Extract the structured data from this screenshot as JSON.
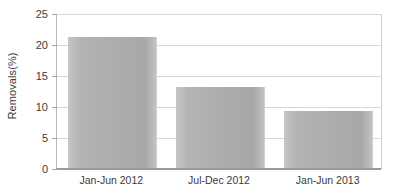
{
  "chart_data": {
    "type": "bar",
    "title": "",
    "subtitle": "",
    "xlabel": "",
    "ylabel": "Removals(%)",
    "categories": [
      "Jan-Jun 2012",
      "Jul-Dec 2012",
      "Jan-Jun 2013"
    ],
    "values": [
      21.1,
      13.1,
      9.2
    ],
    "ylim": [
      0,
      25
    ],
    "yticks": [
      0,
      5,
      10,
      15,
      20,
      25
    ],
    "ytick_labels": [
      "0",
      "5",
      "10",
      "15",
      "20",
      "25"
    ],
    "grid": true,
    "grid_axis": "y",
    "legend": false,
    "legend_position": "none",
    "series": [
      {
        "name": "Removals(%)",
        "values": [
          21.1,
          13.1,
          9.2
        ]
      }
    ],
    "colors": {
      "bar_fill_light": "#c6c6c6",
      "bar_fill_mid": "#b4b4b4",
      "bar_fill_dark": "#a8a8a8",
      "gridline": "#d6d6d6",
      "axis_line": "#9a9a9a",
      "plot_border": "#d2d2d2",
      "text": "#3b3b3b",
      "background": "#ffffff"
    }
  }
}
